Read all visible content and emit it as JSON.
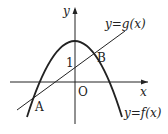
{
  "diagram": {
    "type": "function-graph",
    "axes": {
      "x_label": "x",
      "y_label": "y",
      "origin_label": "O"
    },
    "y_intercept_label": "1",
    "curves": [
      {
        "name": "parabola",
        "label": "y=f(x)"
      },
      {
        "name": "line",
        "label": "y=g(x)"
      }
    ],
    "points": [
      {
        "name": "A",
        "label": "A"
      },
      {
        "name": "B",
        "label": "B"
      }
    ],
    "colors": {
      "stroke": "#222222",
      "background": "#ffffff"
    }
  }
}
